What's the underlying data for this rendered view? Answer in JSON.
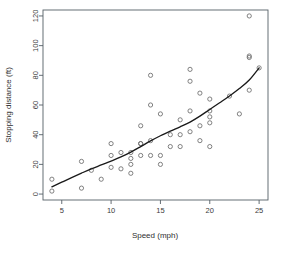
{
  "chart_data": {
    "type": "scatter",
    "title": "",
    "xlabel": "Speed (mph)",
    "ylabel": "Stopping distance (ft)",
    "xlim": [
      3.1,
      25.9
    ],
    "ylim": [
      -4,
      124
    ],
    "grid": false,
    "legend": "none",
    "x_ticks": [
      5,
      10,
      15,
      20,
      25
    ],
    "y_ticks": [
      0,
      20,
      40,
      60,
      80,
      100,
      120
    ],
    "point_marker": "open-circle",
    "point_color": "#6b6b6b",
    "curve_color": "#1a1a1a",
    "curve_label": "lowess smooth",
    "x": [
      4,
      4,
      7,
      7,
      8,
      9,
      10,
      10,
      10,
      11,
      11,
      12,
      12,
      12,
      12,
      13,
      13,
      13,
      13,
      14,
      14,
      14,
      14,
      15,
      15,
      15,
      16,
      16,
      17,
      17,
      17,
      18,
      18,
      18,
      18,
      19,
      19,
      19,
      20,
      20,
      20,
      20,
      20,
      22,
      23,
      24,
      24,
      24,
      24,
      25
    ],
    "y": [
      2,
      10,
      4,
      22,
      16,
      10,
      18,
      26,
      34,
      17,
      28,
      14,
      20,
      24,
      28,
      26,
      34,
      34,
      46,
      26,
      36,
      60,
      80,
      20,
      26,
      54,
      32,
      40,
      32,
      40,
      50,
      42,
      56,
      76,
      84,
      36,
      46,
      68,
      32,
      48,
      52,
      56,
      64,
      66,
      54,
      70,
      92,
      93,
      120,
      85
    ],
    "curve_x": [
      4,
      5,
      6,
      7,
      8,
      9,
      10,
      11,
      12,
      13,
      14,
      15,
      16,
      17,
      18,
      19,
      20,
      21,
      22,
      23,
      24,
      25
    ],
    "curve_y": [
      4.9,
      8.0,
      11.1,
      14.1,
      17.0,
      19.6,
      22.2,
      25.0,
      28.3,
      32.0,
      35.8,
      39.3,
      42.4,
      45.3,
      48.5,
      52.5,
      57.0,
      61.5,
      66.1,
      71.1,
      76.8,
      85.0
    ]
  },
  "axes": {
    "x_title": "Speed (mph)",
    "y_title": "Stopping distance (ft)",
    "x_tick_labels": [
      "5",
      "10",
      "15",
      "20",
      "25"
    ],
    "y_tick_labels": [
      "0",
      "20",
      "40",
      "60",
      "80",
      "100",
      "120"
    ]
  }
}
